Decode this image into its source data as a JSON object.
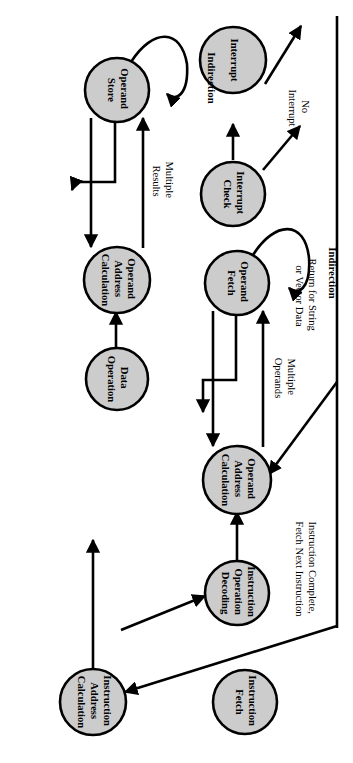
{
  "diagram": {
    "orientation": "rotated-90-clockwise",
    "node_fill": "#cccccc",
    "node_stroke": "#000000",
    "background": "#ffffff",
    "nodes": [
      {
        "id": "instruction-fetch",
        "lines": [
          "Instruction",
          "Fetch"
        ]
      },
      {
        "id": "instruction-address-calculation",
        "lines": [
          "Instruction",
          "Address",
          "Calculation"
        ]
      },
      {
        "id": "instruction-operation-decoding",
        "lines": [
          "Instruction",
          "Operation",
          "Decoding"
        ]
      },
      {
        "id": "operand-address-calculation-lower",
        "lines": [
          "Operand",
          "Address",
          "Calculation"
        ]
      },
      {
        "id": "operand-fetch",
        "lines": [
          "Operand",
          "Fetch"
        ]
      },
      {
        "id": "data-operation",
        "lines": [
          "Data",
          "Operation"
        ]
      },
      {
        "id": "operand-address-calculation-upper",
        "lines": [
          "Operand",
          "Address",
          "Calculation"
        ]
      },
      {
        "id": "operand-store",
        "lines": [
          "Operand",
          "Store"
        ]
      },
      {
        "id": "interrupt-check",
        "lines": [
          "Interrupt",
          "Check"
        ]
      },
      {
        "id": "interrupt",
        "lines": [
          "Interrupt"
        ]
      }
    ],
    "edge_labels": [
      {
        "id": "multiple-operands",
        "lines": [
          "Multiple",
          "Operands"
        ]
      },
      {
        "id": "multiple-results",
        "lines": [
          "Multiple",
          "Results"
        ]
      },
      {
        "id": "no-interrupt",
        "lines": [
          "No",
          "Interrupt"
        ]
      },
      {
        "id": "return-string-vector",
        "lines": [
          "Return for String",
          "or Vector Data"
        ]
      },
      {
        "id": "instruction-complete",
        "lines": [
          "Instruction Complete,",
          "Fetch Next Instruction"
        ]
      }
    ],
    "side_labels": [
      {
        "id": "indirection-fetch",
        "text": "Indirection"
      },
      {
        "id": "indirection-store",
        "text": "Indirection"
      }
    ]
  }
}
